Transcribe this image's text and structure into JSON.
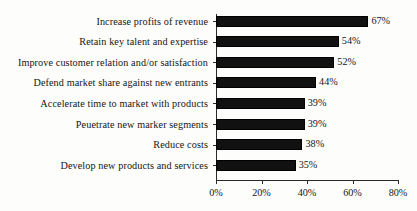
{
  "chart_data": {
    "type": "bar",
    "orientation": "horizontal",
    "title": "",
    "xlabel": "",
    "ylabel": "",
    "categories": [
      "Increase profits of revenue",
      "Retain key talent and expertise",
      "Improve customer relation and/or satisfaction",
      "Defend market share against new entrants",
      "Accelerate time to market with products",
      "Peuetrate new marker segments",
      "Reduce costs",
      "Develop new products and services"
    ],
    "values": [
      67,
      54,
      52,
      44,
      39,
      39,
      38,
      35
    ],
    "data_labels": [
      "67%",
      "54%",
      "52%",
      "44%",
      "39%",
      "39%",
      "38%",
      "35%"
    ],
    "xlim": [
      0,
      80
    ],
    "xticks": [
      0,
      20,
      40,
      60,
      80
    ],
    "xtick_labels": [
      "0%",
      "20%",
      "40%",
      "60%",
      "80%"
    ],
    "grid": false,
    "legend": false,
    "bar_color": "#111111",
    "background_color": "#fdfdfb",
    "axis_color": "#2a2a2a",
    "text_color": "#151515"
  }
}
